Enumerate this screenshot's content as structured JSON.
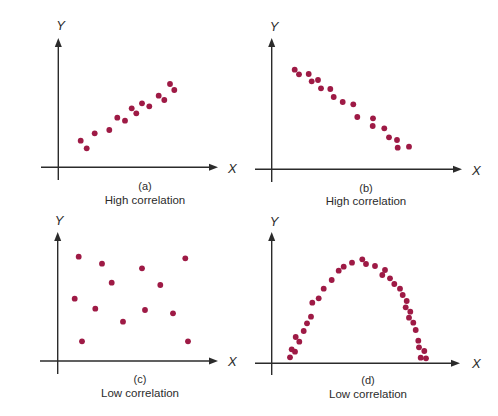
{
  "figure": {
    "dot_color": "#9e1a45",
    "axis_color": "#2b2b2b",
    "dot_radius": 2.9
  },
  "chart_data": [
    {
      "type": "scatter",
      "panel": "(a)",
      "title": "High correlation",
      "xlabel": "X",
      "ylabel": "Y",
      "grid": false,
      "axes": {
        "origin": [
          58.3,
          167.3
        ],
        "x_start": 41,
        "x_end": 218,
        "y_top": 38,
        "y_bottom": 180
      },
      "label_pos": {
        "ylabel": [
          60.7,
          30
        ],
        "xlabel": [
          228,
          173
        ],
        "letter": [
          145,
          190
        ],
        "caption": [
          145,
          204
        ]
      },
      "points": [
        [
          80.7,
          140.7
        ],
        [
          86.7,
          148.3
        ],
        [
          94.7,
          133.3
        ],
        [
          109.3,
          130
        ],
        [
          117.3,
          117.7
        ],
        [
          125,
          120.7
        ],
        [
          131.7,
          108.3
        ],
        [
          136.3,
          113.3
        ],
        [
          142,
          103.3
        ],
        [
          149.3,
          106.3
        ],
        [
          158.7,
          95.7
        ],
        [
          164.3,
          100
        ],
        [
          170,
          84
        ],
        [
          174.3,
          90
        ]
      ]
    },
    {
      "type": "scatter",
      "panel": "(b)",
      "title": "High correlation",
      "xlabel": "X",
      "ylabel": "Y",
      "grid": false,
      "axes": {
        "origin": [
          271.7,
          169.3
        ],
        "x_start": 255,
        "x_end": 462,
        "y_top": 38,
        "y_bottom": 182
      },
      "label_pos": {
        "ylabel": [
          274,
          31
        ],
        "xlabel": [
          472,
          175
        ],
        "letter": [
          366,
          192
        ],
        "caption": [
          366,
          205
        ]
      },
      "points": [
        [
          294.7,
          69.7
        ],
        [
          299,
          74.3
        ],
        [
          308.7,
          74
        ],
        [
          311.7,
          81.3
        ],
        [
          318,
          80
        ],
        [
          321,
          88.3
        ],
        [
          330.3,
          89
        ],
        [
          333.7,
          97
        ],
        [
          342.7,
          102
        ],
        [
          353.3,
          104.3
        ],
        [
          357.3,
          117
        ],
        [
          373,
          118.3
        ],
        [
          372.7,
          126
        ],
        [
          384.3,
          128.3
        ],
        [
          389,
          137.3
        ],
        [
          397,
          140
        ],
        [
          397.7,
          147.7
        ],
        [
          409,
          146.7
        ]
      ]
    },
    {
      "type": "scatter",
      "panel": "(c)",
      "title": "Low correlation",
      "xlabel": "X",
      "ylabel": "Y",
      "grid": false,
      "axes": {
        "origin": [
          57.7,
          361
        ],
        "x_start": 40,
        "x_end": 218,
        "y_top": 232,
        "y_bottom": 374
      },
      "label_pos": {
        "ylabel": [
          59,
          225
        ],
        "xlabel": [
          228,
          366
        ],
        "letter": [
          140,
          383
        ],
        "caption": [
          140,
          397
        ]
      },
      "points": [
        [
          78.7,
          256.7
        ],
        [
          102,
          263.7
        ],
        [
          142,
          268.3
        ],
        [
          185.3,
          258.3
        ],
        [
          111.7,
          282.7
        ],
        [
          160.3,
          285
        ],
        [
          74.7,
          298.7
        ],
        [
          95.3,
          308.7
        ],
        [
          145,
          310
        ],
        [
          173,
          313.3
        ],
        [
          123,
          321.7
        ],
        [
          82,
          341.3
        ],
        [
          188,
          341.3
        ]
      ]
    },
    {
      "type": "scatter",
      "panel": "(d)",
      "title": "Low correlation",
      "xlabel": "X",
      "ylabel": "Y",
      "grid": false,
      "axes": {
        "origin": [
          271.7,
          363.3
        ],
        "x_start": 255,
        "x_end": 460,
        "y_top": 232,
        "y_bottom": 375
      },
      "label_pos": {
        "ylabel": [
          274,
          226
        ],
        "xlabel": [
          472,
          368
        ],
        "letter": [
          368,
          384
        ],
        "caption": [
          368,
          398
        ]
      },
      "points": [
        [
          290,
          357.3
        ],
        [
          291.7,
          349.3
        ],
        [
          295,
          351.7
        ],
        [
          295.7,
          337
        ],
        [
          299.3,
          341.7
        ],
        [
          303.7,
          331
        ],
        [
          307,
          323.3
        ],
        [
          311,
          316.7
        ],
        [
          312.3,
          302.7
        ],
        [
          318.7,
          298.3
        ],
        [
          323.7,
          288.7
        ],
        [
          331.7,
          280
        ],
        [
          338.7,
          270.7
        ],
        [
          343.7,
          266.7
        ],
        [
          352,
          262.7
        ],
        [
          362.3,
          259.3
        ],
        [
          366,
          264
        ],
        [
          375,
          266
        ],
        [
          385,
          270
        ],
        [
          382.3,
          275
        ],
        [
          390,
          278.3
        ],
        [
          394.3,
          284
        ],
        [
          400,
          288.7
        ],
        [
          402.7,
          295
        ],
        [
          406.7,
          301
        ],
        [
          405.7,
          307.3
        ],
        [
          410.3,
          311.7
        ],
        [
          409,
          317.7
        ],
        [
          413.3,
          322.7
        ],
        [
          415.7,
          330
        ],
        [
          418.3,
          340.7
        ],
        [
          419,
          347.3
        ],
        [
          424.3,
          351
        ],
        [
          420.7,
          357.7
        ],
        [
          426,
          358.3
        ]
      ]
    }
  ]
}
